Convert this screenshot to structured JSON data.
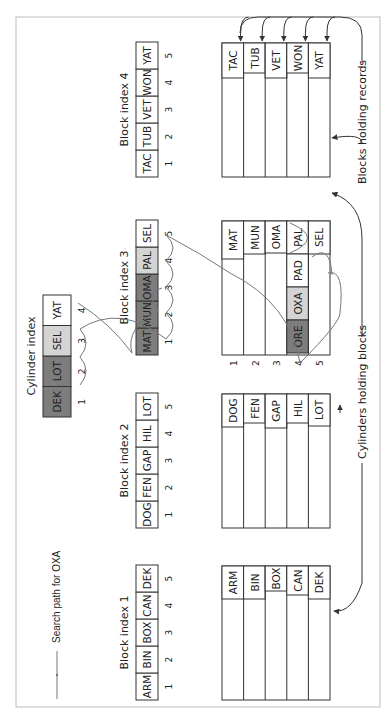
{
  "legend": {
    "label": "Search path for OXA"
  },
  "colors": {
    "dark": "#7d7d7d",
    "light": "#d4d4d4",
    "white": "#ffffff",
    "line": "#333333",
    "path": "#777777"
  },
  "cylinder_index": {
    "title": "Cylinder index",
    "cells": [
      {
        "key": "DEK",
        "num": "1",
        "shade": "dark"
      },
      {
        "key": "LOT",
        "num": "2",
        "shade": "dark"
      },
      {
        "key": "SEL",
        "num": "3",
        "shade": "light"
      },
      {
        "key": "YAT",
        "num": "4",
        "shade": "white"
      }
    ]
  },
  "block_indexes": [
    {
      "title": "Block index 1",
      "cells": [
        {
          "key": "ARM",
          "num": "1",
          "shade": "white"
        },
        {
          "key": "BIN",
          "num": "2",
          "shade": "white"
        },
        {
          "key": "BOX",
          "num": "3",
          "shade": "white"
        },
        {
          "key": "CAN",
          "num": "4",
          "shade": "white"
        },
        {
          "key": "DEK",
          "num": "5",
          "shade": "white"
        }
      ]
    },
    {
      "title": "Block index 2",
      "cells": [
        {
          "key": "DOG",
          "num": "1",
          "shade": "white"
        },
        {
          "key": "FEN",
          "num": "2",
          "shade": "white"
        },
        {
          "key": "GAP",
          "num": "3",
          "shade": "white"
        },
        {
          "key": "HIL",
          "num": "4",
          "shade": "white"
        },
        {
          "key": "LOT",
          "num": "5",
          "shade": "white"
        }
      ]
    },
    {
      "title": "Block index 3",
      "cells": [
        {
          "key": "MAT",
          "num": "1",
          "shade": "dark"
        },
        {
          "key": "MUN",
          "num": "2",
          "shade": "dark"
        },
        {
          "key": "OMA",
          "num": "3",
          "shade": "dark"
        },
        {
          "key": "PAL",
          "num": "4",
          "shade": "light"
        },
        {
          "key": "SEL",
          "num": "5",
          "shade": "white"
        }
      ]
    },
    {
      "title": "Block index 4",
      "cells": [
        {
          "key": "TAC",
          "num": "1",
          "shade": "white"
        },
        {
          "key": "TUB",
          "num": "2",
          "shade": "white"
        },
        {
          "key": "VET",
          "num": "3",
          "shade": "white"
        },
        {
          "key": "WON",
          "num": "4",
          "shade": "white"
        },
        {
          "key": "YAT",
          "num": "5",
          "shade": "white"
        }
      ]
    }
  ],
  "cylinders": [
    {
      "blocks": [
        {
          "records": [
            "ARM"
          ]
        },
        {
          "records": [
            "BIN"
          ]
        },
        {
          "records": [
            "BOX"
          ]
        },
        {
          "records": [
            "CAN"
          ]
        },
        {
          "records": [
            "DEK"
          ]
        }
      ]
    },
    {
      "blocks": [
        {
          "records": [
            "DOG"
          ]
        },
        {
          "records": [
            "FEN"
          ]
        },
        {
          "records": [
            "GAP"
          ]
        },
        {
          "records": [
            "HIL"
          ]
        },
        {
          "records": [
            "LOT"
          ]
        }
      ]
    },
    {
      "block_numbers": [
        "1",
        "2",
        "3",
        "4",
        "5"
      ],
      "blocks": [
        {
          "records": [
            "MAT"
          ]
        },
        {
          "records": [
            "MUN"
          ]
        },
        {
          "records": [
            "OMA"
          ]
        },
        {
          "records": [
            "PAL",
            "PAD",
            "OXA",
            "ORE"
          ]
        },
        {
          "records": [
            "SEL"
          ]
        }
      ]
    },
    {
      "blocks": [
        {
          "records": [
            "TAC"
          ]
        },
        {
          "records": [
            "TUB"
          ]
        },
        {
          "records": [
            "VET"
          ]
        },
        {
          "records": [
            "WON"
          ]
        },
        {
          "records": [
            "YAT"
          ]
        }
      ]
    }
  ],
  "annotations": {
    "cylinders_holding_blocks": "Cylinders holding blocks",
    "blocks_holding_records": "Blocks holding records"
  }
}
